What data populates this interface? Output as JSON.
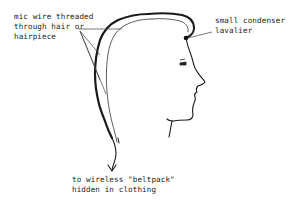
{
  "diagram": {
    "type": "illustration",
    "labels": {
      "wire": {
        "lines": [
          "mic wire threaded",
          "through hair or",
          "hairpiece"
        ]
      },
      "mic": {
        "lines": [
          "small condenser",
          "lavalier"
        ]
      },
      "beltpack": {
        "lines": [
          "to wireless \"beltpack\"",
          "hidden in clothing"
        ]
      }
    },
    "colors": {
      "background": "#ffffff",
      "ink": "#1a1a1a",
      "leader": "#444444"
    }
  }
}
